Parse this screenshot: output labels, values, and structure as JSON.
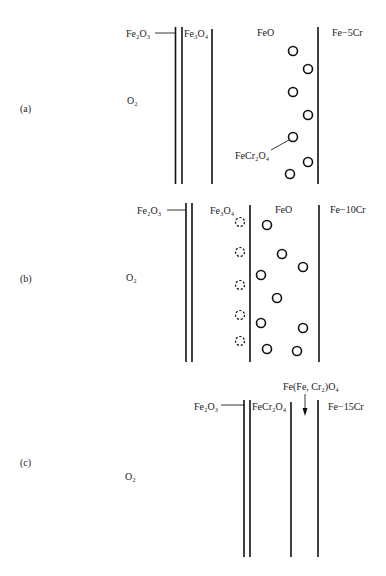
{
  "panels": [
    {
      "id": "a",
      "tag": "(a)",
      "gas": "O2",
      "gas_display": "O₂",
      "layers": [
        "Fe2O3",
        "Fe3O4",
        "FeO"
      ],
      "labels": {
        "fe2o3": "Fe₂O₃",
        "fe3o4": "Fe₃O₄",
        "feo": "FeO",
        "alloy": "Fe−5Cr",
        "precipitate": "FeCr₂O₄"
      },
      "precipitate_particles": 7
    },
    {
      "id": "b",
      "tag": "(b)",
      "gas": "O2",
      "gas_display": "O₂",
      "layers": [
        "Fe2O3",
        "Fe3O4",
        "FeO"
      ],
      "labels": {
        "fe2o3": "Fe₂O₃",
        "fe3o4": "Fe₃O₄",
        "feo": "FeO",
        "alloy": "Fe−10Cr"
      },
      "dashed_particles": 5,
      "solid_particles": 9
    },
    {
      "id": "c",
      "tag": "(c)",
      "gas": "O2",
      "gas_display": "O₂",
      "layers": [
        "Fe2O3",
        "FeCr2O4"
      ],
      "labels": {
        "fe2o3": "Fe₂O₃",
        "fecr2o4": "FeCr₂O₄",
        "spinel": "Fe(Fe, Cr₂)O₄",
        "alloy": "Fe−15Cr"
      }
    }
  ]
}
